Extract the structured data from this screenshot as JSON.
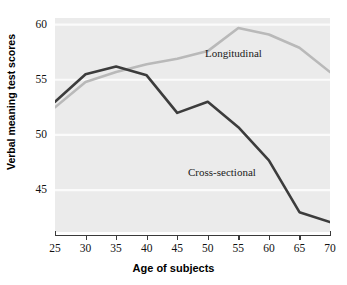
{
  "chart_data": {
    "type": "line",
    "title": "",
    "xlabel": "Age of subjects",
    "ylabel": "Verbal meaning test scores",
    "x": [
      25,
      30,
      35,
      40,
      45,
      50,
      55,
      60,
      65,
      70
    ],
    "xlim": [
      25,
      70
    ],
    "ylim": [
      41.2,
      60.6
    ],
    "xticks": [
      "25",
      "30",
      "35",
      "40",
      "45",
      "50",
      "55",
      "60",
      "65",
      "70"
    ],
    "yticks": [
      "45",
      "50",
      "55",
      "60"
    ],
    "ytick_values": [
      45,
      50,
      55,
      60
    ],
    "grid": true,
    "grid_axis": "y",
    "legend": "inline-annotations",
    "series": [
      {
        "name": "Longitudinal",
        "color": "#b9b9b9",
        "values": [
          52.5,
          54.8,
          55.7,
          56.4,
          56.9,
          57.6,
          59.7,
          59.1,
          57.9,
          55.7
        ]
      },
      {
        "name": "Cross-sectional",
        "color": "#3c3c3c",
        "values": [
          53.0,
          55.5,
          56.2,
          55.4,
          52.0,
          53.0,
          50.7,
          47.7,
          43.0,
          42.1
        ]
      }
    ]
  },
  "annotations": {
    "longitudinal_label": "Longitudinal",
    "cross_sectional_label": "Cross-sectional"
  },
  "axes": {
    "x_title": "Age of subjects",
    "y_title": "Verbal meaning test scores"
  },
  "colors": {
    "plot_background": "#ebebeb",
    "gridline": "#fbfbfb",
    "axis": "#3a3a3a",
    "longitudinal": "#b9b9b9",
    "cross_sectional": "#3c3c3c",
    "page_background": "#ffffff"
  }
}
